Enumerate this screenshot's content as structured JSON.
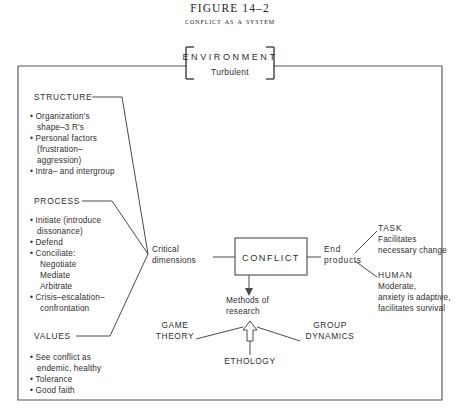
{
  "caption": {
    "figure_number": "FIGURE 14–2",
    "figure_title": "Conflict as a system"
  },
  "environment": {
    "title": "ENVIRONMENT",
    "subtitle": "Turbulent"
  },
  "inputs": [
    {
      "heading": "STRUCTURE",
      "items": [
        "Organization's",
        "shape–3 R's",
        "Personal factors",
        "(frustration–",
        "aggression)",
        "Intra– and intergroup"
      ],
      "bullets": [
        true,
        false,
        true,
        false,
        false,
        true
      ]
    },
    {
      "heading": "PROCESS",
      "items": [
        "Initiate (introduce",
        "dissonance)",
        "Defend",
        "Conciliate:",
        "Negotiate",
        "Mediate",
        "Arbitrate",
        "Crisis–escalation–",
        "confrontation"
      ],
      "bullets": [
        true,
        false,
        true,
        true,
        false,
        false,
        false,
        true,
        false
      ]
    },
    {
      "heading": "VALUES",
      "items": [
        "See conflict as",
        "endemic, healthy",
        "Tolerance",
        "Good faith"
      ],
      "bullets": [
        true,
        false,
        true,
        true
      ]
    }
  ],
  "center": {
    "critical_dimensions_line1": "Critical",
    "critical_dimensions_line2": "dimensions",
    "conflict_box": "CONFLICT",
    "methods_line1": "Methods of",
    "methods_line2": "research"
  },
  "outputs": {
    "end_products_line1": "End",
    "end_products_line2": "products",
    "branches": [
      {
        "heading": "TASK",
        "lines": [
          "Facilitates",
          "necessary change"
        ]
      },
      {
        "heading": "HUMAN",
        "lines": [
          "Moderate,",
          "anxiety is adaptive,",
          "facilitates survival"
        ]
      }
    ]
  },
  "methods": [
    {
      "line1": "GAME",
      "line2": "THEORY"
    },
    {
      "line1": "ETHOLOGY",
      "line2": ""
    },
    {
      "line1": "GROUP",
      "line2": "DYNAMICS"
    }
  ],
  "colors": {
    "ink": "#2e2e2e",
    "line": "#4a4a4a",
    "frame": "#555555",
    "background": "#ffffff"
  }
}
